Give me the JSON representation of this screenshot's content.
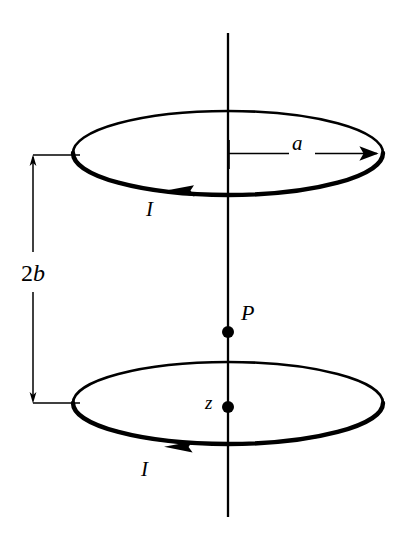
{
  "figure": {
    "type": "helmholtz-coil-diagram",
    "stroke_color": "#000000",
    "background_color": "#ffffff",
    "labels": {
      "radius": "a",
      "separation_number": "2",
      "separation_symbol": "b",
      "separation": "2b",
      "point": "P",
      "axis": "z",
      "current_top": "I",
      "current_bottom": "I"
    },
    "elements": {
      "axis_line": "vertical-axis",
      "top_loop": "current-loop-top",
      "bottom_loop": "current-loop-bottom",
      "radius_arrow": "radius-dimension-arrow",
      "separation_dimension": "separation-dimension-line",
      "point_marker": "field-point-P",
      "origin_marker": "axis-origin-z",
      "current_arrow_top": "current-direction-arrow-top",
      "current_arrow_bottom": "current-direction-arrow-bottom"
    },
    "geometry": {
      "axis_x": 228,
      "axis_top_y": 33,
      "axis_bottom_y": 517,
      "loop_rx": 155,
      "loop_ry": 42,
      "top_loop_cy": 153,
      "bottom_loop_cy": 403,
      "point_P_y": 332,
      "point_z_y": 407,
      "dimension_x": 32,
      "dimension_top_y": 155,
      "dimension_bottom_y": 403
    }
  }
}
